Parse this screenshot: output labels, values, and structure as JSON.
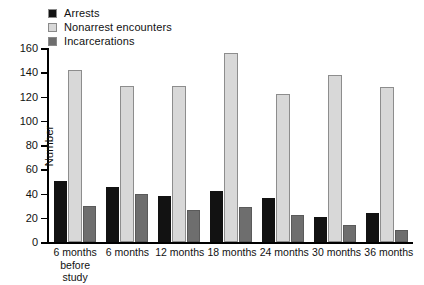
{
  "chart_data": {
    "type": "bar",
    "title": "",
    "xlabel": "",
    "ylabel": "Number",
    "ylim": [
      0,
      160
    ],
    "yticks": [
      0,
      20,
      40,
      60,
      80,
      100,
      120,
      140,
      160
    ],
    "grid": false,
    "legend_position": "top-left",
    "categories": [
      "6 months before study",
      "6 months",
      "12 months",
      "18 months",
      "24 months",
      "30 months",
      "36 months"
    ],
    "category_lines": [
      [
        "6 months",
        "before",
        "study"
      ],
      [
        "6 months"
      ],
      [
        "12 months"
      ],
      [
        "18 months"
      ],
      [
        "24 months"
      ],
      [
        "30 months"
      ],
      [
        "36 months"
      ]
    ],
    "series": [
      {
        "name": "Arrests",
        "color": "#121212",
        "values": [
          50,
          45,
          38,
          42,
          36,
          21,
          24
        ]
      },
      {
        "name": "Nonarrest encounters",
        "color": "#d8d8d8",
        "values": [
          142,
          129,
          129,
          156,
          122,
          138,
          128
        ]
      },
      {
        "name": "Incarcerations",
        "color": "#6e6e6e",
        "values": [
          30,
          40,
          26,
          29,
          22,
          14,
          10
        ]
      }
    ]
  },
  "axis": {
    "y_title": "Number",
    "y_tick_labels": [
      "0",
      "20",
      "40",
      "60",
      "80",
      "100",
      "120",
      "140",
      "160"
    ]
  },
  "legend": {
    "items": [
      {
        "label": "Arrests",
        "color": "#121212"
      },
      {
        "label": "Nonarrest encounters",
        "color": "#d8d8d8"
      },
      {
        "label": "Incarcerations",
        "color": "#6e6e6e"
      }
    ]
  }
}
